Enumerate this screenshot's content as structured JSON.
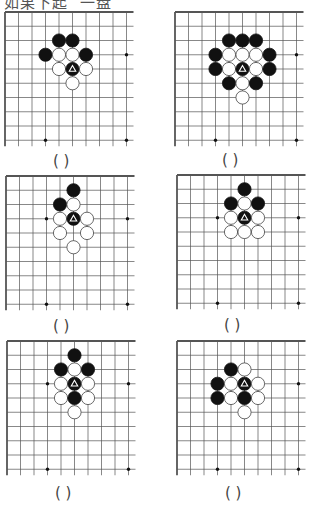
{
  "title": "如果下起  一盘",
  "answer_placeholder": "(    )",
  "colors": {
    "black_stone": "#111111",
    "white_stone": "#ffffff",
    "grid": "#555555",
    "marker_on_black": "#ffffff"
  },
  "boards": [
    {
      "id": 1,
      "star_points": [
        [
          9,
          3
        ],
        [
          3,
          9
        ],
        [
          9,
          9
        ]
      ],
      "stones": [
        {
          "col": 4,
          "row": 2,
          "color": "black"
        },
        {
          "col": 5,
          "row": 2,
          "color": "black"
        },
        {
          "col": 3,
          "row": 3,
          "color": "black"
        },
        {
          "col": 4,
          "row": 3,
          "color": "white"
        },
        {
          "col": 5,
          "row": 3,
          "color": "white"
        },
        {
          "col": 6,
          "row": 3,
          "color": "black"
        },
        {
          "col": 4,
          "row": 4,
          "color": "white"
        },
        {
          "col": 5,
          "row": 4,
          "color": "black",
          "marker": "triangle"
        },
        {
          "col": 6,
          "row": 4,
          "color": "white"
        },
        {
          "col": 5,
          "row": 5,
          "color": "white"
        }
      ]
    },
    {
      "id": 2,
      "star_points": [
        [
          9,
          3
        ],
        [
          3,
          9
        ],
        [
          9,
          9
        ]
      ],
      "stones": [
        {
          "col": 4,
          "row": 2,
          "color": "black"
        },
        {
          "col": 5,
          "row": 2,
          "color": "black"
        },
        {
          "col": 6,
          "row": 2,
          "color": "black"
        },
        {
          "col": 3,
          "row": 3,
          "color": "black"
        },
        {
          "col": 4,
          "row": 3,
          "color": "white"
        },
        {
          "col": 5,
          "row": 3,
          "color": "white"
        },
        {
          "col": 6,
          "row": 3,
          "color": "white"
        },
        {
          "col": 7,
          "row": 3,
          "color": "black"
        },
        {
          "col": 3,
          "row": 4,
          "color": "black"
        },
        {
          "col": 4,
          "row": 4,
          "color": "white"
        },
        {
          "col": 5,
          "row": 4,
          "color": "black",
          "marker": "triangle"
        },
        {
          "col": 6,
          "row": 4,
          "color": "white"
        },
        {
          "col": 7,
          "row": 4,
          "color": "black"
        },
        {
          "col": 4,
          "row": 5,
          "color": "black"
        },
        {
          "col": 5,
          "row": 5,
          "color": "white"
        },
        {
          "col": 6,
          "row": 5,
          "color": "black"
        },
        {
          "col": 5,
          "row": 6,
          "color": "white"
        }
      ]
    },
    {
      "id": 3,
      "star_points": [
        [
          3,
          3
        ],
        [
          9,
          3
        ],
        [
          3,
          9
        ],
        [
          9,
          9
        ]
      ],
      "stones": [
        {
          "col": 5,
          "row": 1,
          "color": "black"
        },
        {
          "col": 4,
          "row": 2,
          "color": "black"
        },
        {
          "col": 5,
          "row": 2,
          "color": "white"
        },
        {
          "col": 4,
          "row": 3,
          "color": "white"
        },
        {
          "col": 5,
          "row": 3,
          "color": "black",
          "marker": "triangle"
        },
        {
          "col": 6,
          "row": 3,
          "color": "white"
        },
        {
          "col": 4,
          "row": 4,
          "color": "white"
        },
        {
          "col": 6,
          "row": 4,
          "color": "white"
        },
        {
          "col": 5,
          "row": 5,
          "color": "white"
        }
      ]
    },
    {
      "id": 4,
      "star_points": [
        [
          3,
          3
        ],
        [
          9,
          3
        ],
        [
          3,
          9
        ],
        [
          9,
          9
        ]
      ],
      "stones": [
        {
          "col": 5,
          "row": 1,
          "color": "black"
        },
        {
          "col": 4,
          "row": 2,
          "color": "black"
        },
        {
          "col": 5,
          "row": 2,
          "color": "white"
        },
        {
          "col": 6,
          "row": 2,
          "color": "black"
        },
        {
          "col": 4,
          "row": 3,
          "color": "white"
        },
        {
          "col": 5,
          "row": 3,
          "color": "black",
          "marker": "triangle"
        },
        {
          "col": 6,
          "row": 3,
          "color": "white"
        },
        {
          "col": 4,
          "row": 4,
          "color": "white"
        },
        {
          "col": 5,
          "row": 4,
          "color": "white"
        },
        {
          "col": 6,
          "row": 4,
          "color": "white"
        }
      ]
    },
    {
      "id": 5,
      "star_points": [
        [
          3,
          3
        ],
        [
          9,
          3
        ],
        [
          3,
          9
        ],
        [
          9,
          9
        ]
      ],
      "stones": [
        {
          "col": 5,
          "row": 1,
          "color": "black"
        },
        {
          "col": 4,
          "row": 2,
          "color": "black"
        },
        {
          "col": 5,
          "row": 2,
          "color": "white"
        },
        {
          "col": 6,
          "row": 2,
          "color": "black"
        },
        {
          "col": 4,
          "row": 3,
          "color": "white"
        },
        {
          "col": 5,
          "row": 3,
          "color": "black",
          "marker": "triangle"
        },
        {
          "col": 6,
          "row": 3,
          "color": "white"
        },
        {
          "col": 4,
          "row": 4,
          "color": "white"
        },
        {
          "col": 5,
          "row": 4,
          "color": "black"
        },
        {
          "col": 6,
          "row": 4,
          "color": "white"
        },
        {
          "col": 5,
          "row": 5,
          "color": "white"
        }
      ]
    },
    {
      "id": 6,
      "star_points": [
        [
          9,
          3
        ],
        [
          3,
          9
        ],
        [
          9,
          9
        ]
      ],
      "stones": [
        {
          "col": 4,
          "row": 2,
          "color": "black"
        },
        {
          "col": 5,
          "row": 2,
          "color": "white"
        },
        {
          "col": 3,
          "row": 3,
          "color": "black"
        },
        {
          "col": 4,
          "row": 3,
          "color": "white"
        },
        {
          "col": 5,
          "row": 3,
          "color": "black",
          "marker": "triangle"
        },
        {
          "col": 6,
          "row": 3,
          "color": "white"
        },
        {
          "col": 3,
          "row": 4,
          "color": "black"
        },
        {
          "col": 4,
          "row": 4,
          "color": "white"
        },
        {
          "col": 5,
          "row": 4,
          "color": "black"
        },
        {
          "col": 6,
          "row": 4,
          "color": "white"
        },
        {
          "col": 5,
          "row": 5,
          "color": "white"
        }
      ]
    }
  ]
}
